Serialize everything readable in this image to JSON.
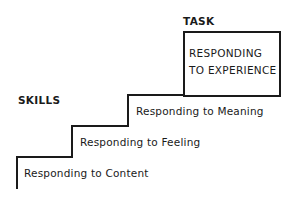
{
  "headings": {
    "task": "TASK",
    "skills": "SKILLS"
  },
  "task_box": {
    "line1": "RESPONDING",
    "line2": "TO EXPERIENCE"
  },
  "steps": [
    {
      "label": "Responding to Content"
    },
    {
      "label": "Responding to Feeling"
    },
    {
      "label": "Responding to Meaning"
    }
  ]
}
